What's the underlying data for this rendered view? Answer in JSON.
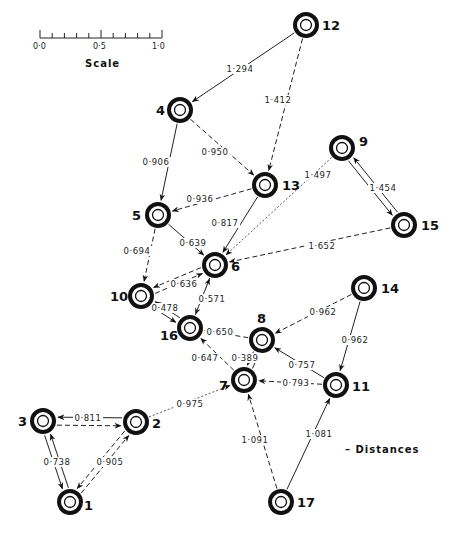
{
  "scale": {
    "title": "Scale",
    "ticks": [
      "0·0",
      "0·5",
      "1·0"
    ]
  },
  "legend": {
    "label": "– Distances"
  },
  "nodes": [
    {
      "id": "12",
      "x": 306,
      "y": 25,
      "lx": 16,
      "ly": 5
    },
    {
      "id": "4",
      "x": 180,
      "y": 110,
      "lx": -24,
      "ly": 5
    },
    {
      "id": "13",
      "x": 265,
      "y": 185,
      "lx": 17,
      "ly": 5
    },
    {
      "id": "9",
      "x": 342,
      "y": 148,
      "lx": 17,
      "ly": -2
    },
    {
      "id": "15",
      "x": 404,
      "y": 225,
      "lx": 17,
      "ly": 5
    },
    {
      "id": "5",
      "x": 158,
      "y": 215,
      "lx": -26,
      "ly": 5
    },
    {
      "id": "6",
      "x": 215,
      "y": 265,
      "lx": 16,
      "ly": 6
    },
    {
      "id": "10",
      "x": 141,
      "y": 296,
      "lx": -31,
      "ly": 5
    },
    {
      "id": "16",
      "x": 190,
      "y": 328,
      "lx": -30,
      "ly": 12
    },
    {
      "id": "14",
      "x": 364,
      "y": 288,
      "lx": 17,
      "ly": 5
    },
    {
      "id": "8",
      "x": 262,
      "y": 340,
      "lx": -5,
      "ly": -17
    },
    {
      "id": "7",
      "x": 244,
      "y": 380,
      "lx": -25,
      "ly": 10
    },
    {
      "id": "11",
      "x": 336,
      "y": 385,
      "lx": 16,
      "ly": 6
    },
    {
      "id": "3",
      "x": 43,
      "y": 421,
      "lx": -25,
      "ly": 5
    },
    {
      "id": "2",
      "x": 136,
      "y": 422,
      "lx": 16,
      "ly": 6
    },
    {
      "id": "1",
      "x": 70,
      "y": 502,
      "lx": 14,
      "ly": 8
    },
    {
      "id": "17",
      "x": 281,
      "y": 502,
      "lx": 16,
      "ly": 5
    }
  ],
  "edges": [
    {
      "from": "12",
      "to": "4",
      "distance": "1·294",
      "style": "solid",
      "label_x": 240,
      "label_y": 72
    },
    {
      "from": "12",
      "to": "13",
      "distance": "1·412",
      "style": "dashed",
      "label_x": 278,
      "label_y": 103
    },
    {
      "from": "4",
      "to": "13",
      "distance": "0·950",
      "style": "dashed",
      "label_x": 215,
      "label_y": 155
    },
    {
      "from": "4",
      "to": "5",
      "distance": "0·906",
      "style": "solid",
      "label_x": 156,
      "label_y": 165
    },
    {
      "from": "13",
      "to": "5",
      "distance": "0·936",
      "style": "dashed",
      "label_x": 200,
      "label_y": 202
    },
    {
      "from": "13",
      "to": "6",
      "distance": "0·817",
      "style": "solid",
      "label_x": 225,
      "label_y": 226
    },
    {
      "from": "9",
      "to": "6",
      "distance": "1·497",
      "style": "dotted",
      "label_x": 318,
      "label_y": 178
    },
    {
      "from": "9",
      "to": "15",
      "distance": "1·454",
      "style": "solid-pair",
      "label_x": 383,
      "label_y": 191
    },
    {
      "from": "15",
      "to": "6",
      "distance": "1·652",
      "style": "dashed",
      "label_x": 322,
      "label_y": 249
    },
    {
      "from": "5",
      "to": "6",
      "distance": "0·639",
      "style": "solid",
      "label_x": 193,
      "label_y": 246
    },
    {
      "from": "5",
      "to": "10",
      "distance": "0·694",
      "style": "dashed",
      "label_x": 137,
      "label_y": 254
    },
    {
      "from": "10",
      "to": "6",
      "distance": "0·636",
      "style": "dashed-pair",
      "label_x": 184,
      "label_y": 287
    },
    {
      "from": "6",
      "to": "16",
      "distance": "0·571",
      "style": "solid",
      "label_x": 212,
      "label_y": 302
    },
    {
      "from": "16",
      "to": "6",
      "distance": "",
      "style": "dotted",
      "label_x": 0,
      "label_y": 0
    },
    {
      "from": "10",
      "to": "16",
      "distance": "0·478",
      "style": "solid-pair",
      "label_x": 165,
      "label_y": 311
    },
    {
      "from": "8",
      "to": "16",
      "distance": "0·650",
      "style": "dashed",
      "label_x": 220,
      "label_y": 335
    },
    {
      "from": "7",
      "to": "16",
      "distance": "0·647",
      "style": "dashed",
      "label_x": 205,
      "label_y": 361
    },
    {
      "from": "7",
      "to": "8",
      "distance": "0·389",
      "style": "solid-pair",
      "label_x": 245,
      "label_y": 361
    },
    {
      "from": "14",
      "to": "8",
      "distance": "0·962",
      "style": "dashed",
      "label_x": 323,
      "label_y": 315
    },
    {
      "from": "14",
      "to": "11",
      "distance": "0·962",
      "style": "solid",
      "label_x": 355,
      "label_y": 343
    },
    {
      "from": "11",
      "to": "8",
      "distance": "0·757",
      "style": "solid",
      "label_x": 302,
      "label_y": 368
    },
    {
      "from": "11",
      "to": "7",
      "distance": "0·793",
      "style": "dashed",
      "label_x": 296,
      "label_y": 386
    },
    {
      "from": "2",
      "to": "7",
      "distance": "0·975",
      "style": "dotted",
      "label_x": 190,
      "label_y": 407
    },
    {
      "from": "2",
      "to": "3",
      "distance": "0·811",
      "style": "solid-dashed-pair",
      "label_x": 88,
      "label_y": 421
    },
    {
      "from": "3",
      "to": "1",
      "distance": "0·738",
      "style": "solid-pair",
      "label_x": 57,
      "label_y": 465
    },
    {
      "from": "1",
      "to": "2",
      "distance": "0·905",
      "style": "dashed-pair",
      "label_x": 110,
      "label_y": 465
    },
    {
      "from": "17",
      "to": "7",
      "distance": "1·091",
      "style": "dashed",
      "label_x": 255,
      "label_y": 443
    },
    {
      "from": "17",
      "to": "11",
      "distance": "1·081",
      "style": "solid",
      "label_x": 319,
      "label_y": 437
    }
  ]
}
